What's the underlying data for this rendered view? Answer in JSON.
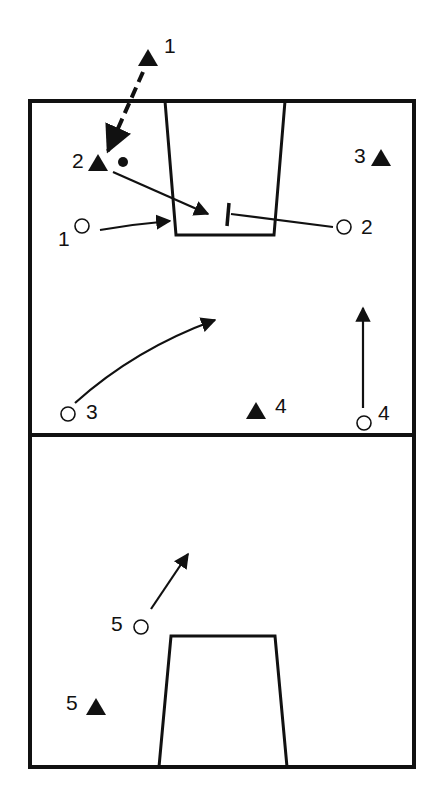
{
  "diagram": {
    "type": "basketball-play",
    "colors": {
      "ink": "#111111",
      "background": "#ffffff"
    },
    "court": {
      "outline": {
        "x": 30,
        "y": 101,
        "w": 384,
        "h": 666
      },
      "midcourt_y": 435,
      "top_key": {
        "top_left_x": 165,
        "top_right_x": 285,
        "bottom_left_x": 176,
        "bottom_right_x": 274,
        "top_y": 101,
        "bottom_y": 235
      },
      "bottom_key": {
        "top_left_x": 171,
        "top_right_x": 275,
        "bottom_left_x": 159,
        "bottom_right_x": 287,
        "top_y": 636,
        "bottom_y": 767
      }
    },
    "offense": [
      {
        "id": "o1",
        "label": "1",
        "x": 82,
        "y": 226,
        "label_x": 58,
        "label_y": 246
      },
      {
        "id": "o2",
        "label": "2",
        "x": 344,
        "y": 227,
        "label_x": 361,
        "label_y": 234
      },
      {
        "id": "o3",
        "label": "3",
        "x": 68,
        "y": 414,
        "label_x": 86,
        "label_y": 419
      },
      {
        "id": "o4",
        "label": "4",
        "x": 364,
        "y": 423,
        "label_x": 378,
        "label_y": 420
      },
      {
        "id": "o5",
        "label": "5",
        "x": 141,
        "y": 627,
        "label_x": 111,
        "label_y": 631
      }
    ],
    "defense": [
      {
        "id": "d1",
        "label": "1",
        "x": 148,
        "y": 58,
        "label_x": 164,
        "label_y": 53
      },
      {
        "id": "d2",
        "label": "2",
        "x": 98,
        "y": 163,
        "label_x": 72,
        "label_y": 168
      },
      {
        "id": "d3",
        "label": "3",
        "x": 381,
        "y": 158,
        "label_x": 354,
        "label_y": 163
      },
      {
        "id": "d4",
        "label": "4",
        "x": 256,
        "y": 411,
        "label_x": 275,
        "label_y": 413
      },
      {
        "id": "d5",
        "label": "5",
        "x": 96,
        "y": 707,
        "label_x": 66,
        "label_y": 710
      }
    ],
    "ball": {
      "x": 123,
      "y": 162,
      "r": 5
    },
    "actions": [
      {
        "id": "pass-d1-to-d2",
        "kind": "pass-dashed",
        "path": "M143 72 L108 151"
      },
      {
        "id": "cut-d2",
        "kind": "cut",
        "path": "M113 172 L208 214"
      },
      {
        "id": "cut-o1",
        "kind": "cut",
        "path": "M100 230 Q135 224 170 221"
      },
      {
        "id": "screen-o2",
        "kind": "screen",
        "path": "M333 227 L231 214",
        "bar": "M229 203 L227 226"
      },
      {
        "id": "cut-o3",
        "kind": "cut",
        "path": "M75 403 Q135 349 215 320"
      },
      {
        "id": "cut-o4",
        "kind": "cut",
        "path": "M363 408 L363 308"
      },
      {
        "id": "cut-o5",
        "kind": "cut",
        "path": "M151 609 L188 554"
      }
    ]
  }
}
